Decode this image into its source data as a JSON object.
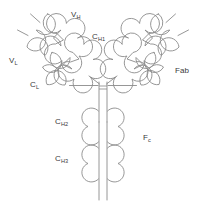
{
  "figure": {
    "background_color": "#ffffff",
    "stroke_color": "#8b8b8b",
    "label_color": "#3a3a3a",
    "labels": {
      "vh": {
        "base": "V",
        "sub": "H",
        "full": "VH"
      },
      "ch1": {
        "base": "C",
        "sub": "H1",
        "full": "CH1"
      },
      "vl": {
        "base": "V",
        "sub": "L",
        "full": "VL"
      },
      "cl": {
        "base": "C",
        "sub": "L",
        "full": "CL"
      },
      "fab": {
        "base": "Fab",
        "sub": "",
        "full": "Fab"
      },
      "ch2": {
        "base": "C",
        "sub": "H2",
        "full": "CH2"
      },
      "fc": {
        "base": "F",
        "sub": "c",
        "full": "Fc"
      },
      "ch3": {
        "base": "C",
        "sub": "H3",
        "full": "CH3"
      }
    }
  }
}
